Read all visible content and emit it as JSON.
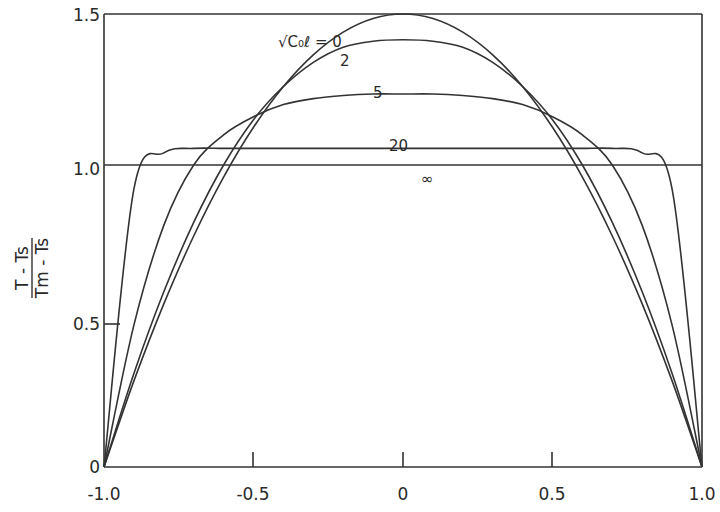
{
  "chart_data": {
    "type": "line",
    "title": "",
    "xlabel": "",
    "ylabel": "(T - Ts) / (Tm - Ts)",
    "ylabel_numerator": "T - Ts",
    "ylabel_denominator": "Tm - Ts",
    "xlim": [
      -1.0,
      1.0
    ],
    "ylim": [
      0,
      1.5
    ],
    "x_ticks": [
      "-1.0",
      "-0.5",
      "0",
      "0.5",
      "1.0"
    ],
    "y_ticks": [
      "0",
      "0.5",
      "1.0",
      "1.5"
    ],
    "grid": false,
    "legend": "inline curve labels",
    "parameter_label": "√C₀ℓ",
    "x": [
      -1.0,
      -0.9,
      -0.8,
      -0.7,
      -0.6,
      -0.5,
      -0.4,
      -0.3,
      -0.2,
      -0.1,
      0.0,
      0.1,
      0.2,
      0.3,
      0.4,
      0.5,
      0.6,
      0.7,
      0.8,
      0.9,
      1.0
    ],
    "series": [
      {
        "name": "√C₀ℓ = 0",
        "label": "√C₀ℓ = 0",
        "values": [
          0,
          0.285,
          0.54,
          0.765,
          0.96,
          1.125,
          1.26,
          1.365,
          1.44,
          1.485,
          1.5,
          1.485,
          1.44,
          1.365,
          1.26,
          1.125,
          0.96,
          0.765,
          0.54,
          0.285,
          0
        ]
      },
      {
        "name": "√C₀ℓ = 2",
        "label": "2",
        "values": [
          0,
          0.31,
          0.58,
          0.81,
          1.0,
          1.15,
          1.26,
          1.34,
          1.39,
          1.41,
          1.415,
          1.41,
          1.39,
          1.34,
          1.26,
          1.15,
          1.0,
          0.81,
          0.58,
          0.31,
          0
        ]
      },
      {
        "name": "√C₀ℓ = 5",
        "label": "5",
        "values": [
          0,
          0.47,
          0.8,
          1.0,
          1.1,
          1.16,
          1.2,
          1.22,
          1.23,
          1.235,
          1.235,
          1.235,
          1.23,
          1.22,
          1.2,
          1.16,
          1.1,
          1.0,
          0.8,
          0.47,
          0
        ]
      },
      {
        "name": "√C₀ℓ = 20",
        "label": "20",
        "values": [
          0,
          0.92,
          1.04,
          1.055,
          1.055,
          1.055,
          1.055,
          1.055,
          1.055,
          1.055,
          1.055,
          1.055,
          1.055,
          1.055,
          1.055,
          1.055,
          1.055,
          1.055,
          1.04,
          0.92,
          0
        ]
      },
      {
        "name": "√C₀ℓ = ∞",
        "label": "∞",
        "values": [
          1.0,
          1.0,
          1.0,
          1.0,
          1.0,
          1.0,
          1.0,
          1.0,
          1.0,
          1.0,
          1.0,
          1.0,
          1.0,
          1.0,
          1.0,
          1.0,
          1.0,
          1.0,
          1.0,
          1.0,
          1.0
        ]
      }
    ],
    "annotations": [
      "√C₀ℓ = 0",
      "2",
      "5",
      "20",
      "∞"
    ]
  },
  "labels": {
    "x_ticks": [
      "-1.0",
      "-0.5",
      "0",
      "0.5",
      "1.0"
    ],
    "y_ticks": [
      "0",
      "0.5",
      "1.0",
      "1.5"
    ],
    "ylabel_numerator": "T - Ts",
    "ylabel_denominator": "Tm - Ts",
    "curve_0": "√C₀ℓ = 0",
    "curve_2": "2",
    "curve_5": "5",
    "curve_20": "20",
    "curve_inf": "∞"
  }
}
